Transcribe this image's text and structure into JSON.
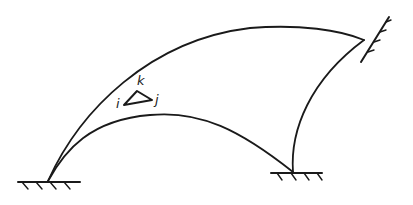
{
  "diagram": {
    "element": {
      "labels": {
        "i": "i",
        "j": "j",
        "k": "k"
      }
    },
    "supports": [
      {
        "name": "left-fixed-support"
      },
      {
        "name": "middle-fixed-support"
      },
      {
        "name": "top-right-fixed-support"
      }
    ],
    "colors": {
      "stroke": "#1a1a1a",
      "background": "#ffffff"
    }
  }
}
